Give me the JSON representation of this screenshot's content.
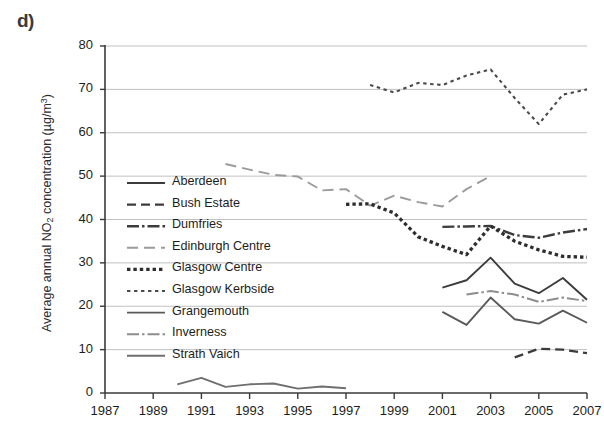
{
  "panel": {
    "label": "d)"
  },
  "axes": {
    "y_title_pre": "Average annual NO",
    "y_title_sub": "2",
    "y_title_post": " concentration (µg/m",
    "y_title_sup": "3",
    "y_title_end": ")",
    "y_ticks": [
      "0",
      "10",
      "20",
      "30",
      "40",
      "50",
      "60",
      "70",
      "80"
    ],
    "x_ticks": [
      "1987",
      "1989",
      "1991",
      "1993",
      "1995",
      "1997",
      "1999",
      "2001",
      "2003",
      "2005",
      "2007"
    ]
  },
  "legend": {
    "items": [
      {
        "label": "Aberdeen",
        "style": "solid-dark"
      },
      {
        "label": "Bush Estate",
        "style": "dashed-dark"
      },
      {
        "label": "Dumfries",
        "style": "dashdot-dark"
      },
      {
        "label": "Edinburgh Centre",
        "style": "dashed-light"
      },
      {
        "label": "Glasgow Centre",
        "style": "dotted-thick-dark"
      },
      {
        "label": "Glasgow Kerbside",
        "style": "dotted-dark"
      },
      {
        "label": "Grangemouth",
        "style": "solid-dark2"
      },
      {
        "label": "Inverness",
        "style": "dashdot-light"
      },
      {
        "label": "Strath Vaich",
        "style": "solid-grey"
      }
    ]
  },
  "colors": {
    "dark": "#3c3c3c",
    "mid": "#5a5a5a",
    "light": "#9b9b9b",
    "grid": "#b9b9b9",
    "axis": "#3a3a3a"
  },
  "chart_data": {
    "type": "line",
    "title": "",
    "xlabel": "",
    "ylabel": "Average annual NO2 concentration (µg/m3)",
    "xlim": [
      1987,
      2007
    ],
    "ylim": [
      0,
      80
    ],
    "ytick_step": 10,
    "xtick_step": 2,
    "grid": "horizontal",
    "legend_position": "inside-left",
    "series": [
      {
        "name": "Aberdeen",
        "style": "solid-dark",
        "x": [
          2001,
          2002,
          2003,
          2004,
          2005,
          2006,
          2007
        ],
        "values": [
          24.3,
          26.0,
          31.2,
          25.2,
          23.0,
          26.5,
          21.5
        ]
      },
      {
        "name": "Bush Estate",
        "style": "dashed-dark",
        "x": [
          2004,
          2005,
          2006,
          2007
        ],
        "values": [
          8.2,
          10.2,
          10.0,
          9.2
        ]
      },
      {
        "name": "Dumfries",
        "style": "dashdot-dark",
        "x": [
          2001,
          2002,
          2003,
          2004,
          2005,
          2006,
          2007
        ],
        "values": [
          38.3,
          38.4,
          38.5,
          36.4,
          35.8,
          37.0,
          37.8
        ]
      },
      {
        "name": "Edinburgh Centre",
        "style": "dashed-light",
        "x": [
          1992,
          1993,
          1994,
          1995,
          1996,
          1997,
          1998,
          1999,
          2000,
          2001,
          2002,
          2003
        ],
        "values": [
          52.8,
          51.5,
          50.3,
          49.9,
          46.7,
          47.0,
          43.2,
          45.5,
          44.0,
          43.0,
          47.0,
          50.0
        ]
      },
      {
        "name": "Glasgow Centre",
        "style": "dotted-thick-dark",
        "x": [
          1997,
          1998,
          1999,
          2000,
          2001,
          2002,
          2003,
          2004,
          2005,
          2006,
          2007
        ],
        "values": [
          43.5,
          43.6,
          41.5,
          36.0,
          33.8,
          31.9,
          38.5,
          35.0,
          33.0,
          31.5,
          31.3
        ]
      },
      {
        "name": "Glasgow Kerbside",
        "style": "dotted-dark",
        "x": [
          1998,
          1999,
          2000,
          2001,
          2002,
          2003,
          2004,
          2005,
          2006,
          2007
        ],
        "values": [
          71.0,
          69.3,
          71.5,
          71.0,
          73.2,
          74.6,
          68.0,
          62.0,
          68.8,
          70.0
        ]
      },
      {
        "name": "Grangemouth",
        "style": "solid-dark2",
        "x": [
          2001,
          2002,
          2003,
          2004,
          2005,
          2006,
          2007
        ],
        "values": [
          18.7,
          15.7,
          22.0,
          17.0,
          16.0,
          19.0,
          16.2
        ]
      },
      {
        "name": "Inverness",
        "style": "dashdot-light",
        "x": [
          2002,
          2003,
          2004,
          2005,
          2006,
          2007
        ],
        "values": [
          22.7,
          23.5,
          22.7,
          21.0,
          22.0,
          21.2
        ]
      },
      {
        "name": "Strath Vaich",
        "style": "solid-grey",
        "x": [
          1990,
          1991,
          1992,
          1993,
          1994,
          1995,
          1996,
          1997
        ],
        "values": [
          2.0,
          3.5,
          1.4,
          2.0,
          2.2,
          1.0,
          1.5,
          1.1
        ]
      }
    ]
  }
}
